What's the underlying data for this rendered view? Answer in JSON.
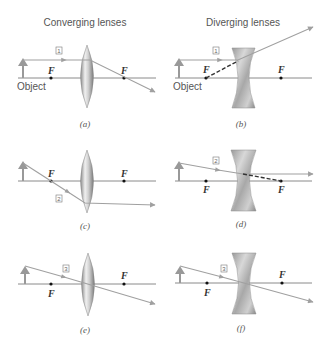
{
  "titles": {
    "left": "Converging lenses",
    "right": "Diverging lenses"
  },
  "labels": {
    "object": "Object",
    "focal": "F"
  },
  "ray_numbers": {
    "ray1": "1",
    "ray2": "2",
    "ray3": "3"
  },
  "captions": {
    "a": "(a)",
    "b": "(b)",
    "c": "(c)",
    "d": "(d)",
    "e": "(e)",
    "f": "(f)"
  },
  "colors": {
    "axis": "#8a8a8a",
    "ray": "#a0a0a0",
    "lens_light": "#f2f2f2",
    "lens_dark": "#7a7a7a",
    "dashed_ray": "#333333"
  }
}
